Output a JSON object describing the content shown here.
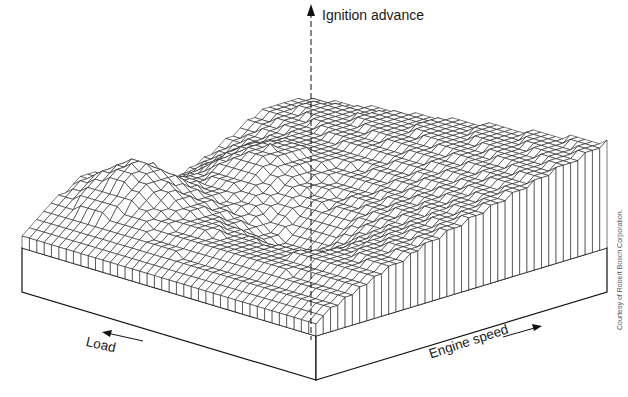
{
  "figure": {
    "type": "3d-surface-wireframe",
    "colors": {
      "ink": "#111111",
      "background": "#ffffff",
      "credit": "#555555"
    }
  },
  "axes": {
    "z_label": "Ignition advance",
    "x_label": "Load",
    "y_label": "Engine speed",
    "x_arrow_direction": "left",
    "y_arrow_direction": "right",
    "z_arrow_direction": "up"
  },
  "credit": "Courtesy of Robert Bosch Corporation."
}
